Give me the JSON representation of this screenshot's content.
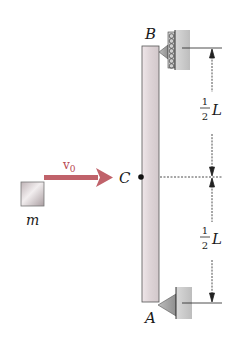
{
  "diagram": {
    "type": "mechanics-free-body",
    "labels": {
      "top_support": "B",
      "bottom_support": "A",
      "center": "C",
      "mass": "m",
      "velocity": "v",
      "velocity_subscript": "0",
      "upper_dim_num": "1",
      "upper_dim_den": "2",
      "upper_dim_var": "L",
      "lower_dim_num": "1",
      "lower_dim_den": "2",
      "lower_dim_var": "L"
    },
    "colors": {
      "arrow": "#c0626a",
      "bar": "#e6dde0",
      "wall": "#c8c8c8",
      "line": "#1a1a1a"
    }
  }
}
